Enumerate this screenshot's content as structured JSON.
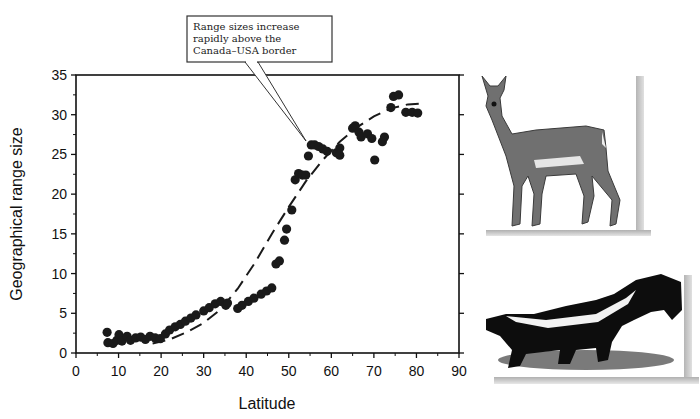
{
  "chart_data": {
    "type": "scatter",
    "title": "",
    "xlabel": "Latitude",
    "ylabel": "Geographical range size",
    "xlim": [
      0,
      90
    ],
    "ylim": [
      0,
      35
    ],
    "xticks": [
      0,
      10,
      20,
      30,
      40,
      50,
      60,
      70,
      80,
      90
    ],
    "yticks": [
      0,
      5,
      10,
      15,
      20,
      25,
      30,
      35
    ],
    "grid": false,
    "legend": null,
    "annotation": {
      "text_lines": [
        "Range sizes increase",
        "rapidly above the",
        "Canada–USA border"
      ],
      "points_to": [
        55,
        26.5
      ]
    },
    "series": [
      {
        "name": "observed",
        "style": "points",
        "color": "#1a1a1a",
        "points": [
          [
            7.3,
            2.6
          ],
          [
            7.5,
            1.3
          ],
          [
            8.7,
            1.2
          ],
          [
            9.6,
            1.6
          ],
          [
            10.1,
            2.3
          ],
          [
            10.8,
            1.5
          ],
          [
            12.0,
            2.1
          ],
          [
            12.8,
            1.6
          ],
          [
            14.0,
            1.9
          ],
          [
            15.2,
            2.0
          ],
          [
            16.3,
            1.7
          ],
          [
            17.4,
            2.1
          ],
          [
            18.6,
            1.9
          ],
          [
            19.8,
            1.8
          ],
          [
            21.0,
            2.4
          ],
          [
            22.0,
            2.9
          ],
          [
            23.3,
            3.3
          ],
          [
            24.5,
            3.6
          ],
          [
            25.7,
            4.0
          ],
          [
            27.0,
            4.4
          ],
          [
            28.2,
            4.8
          ],
          [
            30.0,
            5.3
          ],
          [
            31.3,
            5.7
          ],
          [
            32.7,
            6.2
          ],
          [
            34.0,
            6.5
          ],
          [
            35.2,
            6.0
          ],
          [
            35.6,
            6.3
          ],
          [
            38.0,
            5.6
          ],
          [
            39.0,
            6.0
          ],
          [
            40.5,
            6.5
          ],
          [
            41.8,
            6.9
          ],
          [
            43.5,
            7.4
          ],
          [
            44.8,
            7.8
          ],
          [
            46.0,
            8.2
          ],
          [
            47.0,
            11.2
          ],
          [
            47.8,
            11.6
          ],
          [
            49.0,
            14.2
          ],
          [
            49.5,
            15.6
          ],
          [
            50.7,
            18.0
          ],
          [
            51.5,
            21.8
          ],
          [
            52.3,
            22.6
          ],
          [
            53.2,
            22.4
          ],
          [
            54.0,
            22.4
          ],
          [
            54.6,
            24.8
          ],
          [
            55.3,
            26.2
          ],
          [
            56.1,
            26.2
          ],
          [
            57.0,
            26.0
          ],
          [
            58.0,
            25.7
          ],
          [
            59.0,
            25.4
          ],
          [
            61.2,
            25.2
          ],
          [
            62.0,
            25.8
          ],
          [
            62.0,
            24.9
          ],
          [
            65.0,
            28.3
          ],
          [
            65.6,
            28.6
          ],
          [
            66.5,
            27.8
          ],
          [
            67.0,
            27.2
          ],
          [
            68.5,
            27.6
          ],
          [
            69.5,
            27.0
          ],
          [
            70.2,
            24.3
          ],
          [
            72.0,
            26.6
          ],
          [
            72.5,
            27.2
          ],
          [
            74.0,
            30.9
          ],
          [
            74.6,
            32.3
          ],
          [
            75.8,
            32.5
          ],
          [
            77.5,
            30.3
          ],
          [
            79.0,
            30.3
          ],
          [
            80.3,
            30.2
          ]
        ]
      },
      {
        "name": "predicted",
        "style": "dashed-line",
        "color": "#1a1a1a",
        "points": [
          [
            18,
            1.2
          ],
          [
            22,
            1.7
          ],
          [
            26,
            2.6
          ],
          [
            30,
            3.8
          ],
          [
            34,
            5.5
          ],
          [
            38,
            8.1
          ],
          [
            42,
            11.3
          ],
          [
            46,
            15.0
          ],
          [
            50,
            18.4
          ],
          [
            54,
            21.6
          ],
          [
            58,
            24.3
          ],
          [
            62,
            26.6
          ],
          [
            66,
            28.4
          ],
          [
            70,
            29.8
          ],
          [
            74,
            30.8
          ],
          [
            78,
            31.3
          ],
          [
            81,
            31.4
          ]
        ]
      }
    ]
  },
  "images": [
    {
      "name": "white-tailed-deer-illustration",
      "alt": "Deer"
    },
    {
      "name": "striped-skunk-illustration",
      "alt": "Skunk"
    }
  ]
}
